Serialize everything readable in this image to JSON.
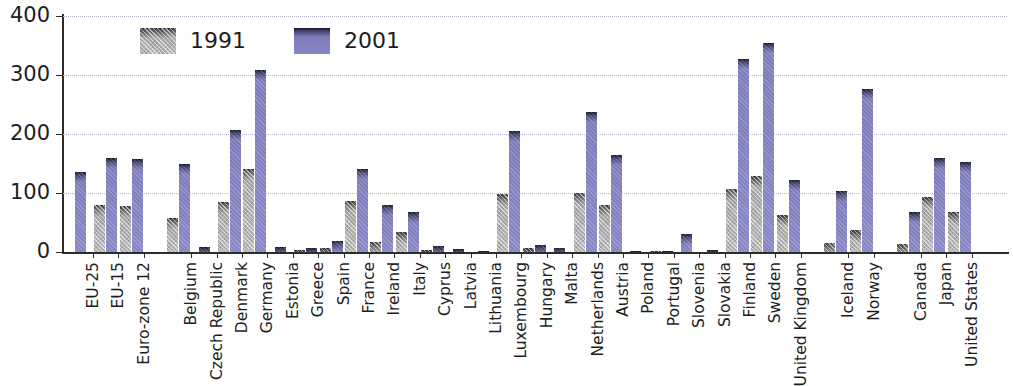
{
  "chart_data": {
    "type": "bar",
    "title": "",
    "subtitle": "",
    "xlabel": "",
    "ylabel": "",
    "ylim": [
      0,
      400
    ],
    "yticks": [
      0,
      100,
      200,
      300,
      400
    ],
    "grid": true,
    "legend_position": "top-left",
    "legend": [
      "1991",
      "2001"
    ],
    "categories": [
      "EU-25",
      "EU-15",
      "Euro-zone 12",
      "Belgium",
      "Czech Republic",
      "Denmark",
      "Germany",
      "Estonia",
      "Greece",
      "Spain",
      "France",
      "Ireland",
      "Italy",
      "Cyprus",
      "Latvia",
      "Lithuania",
      "Luxembourg",
      "Hungary",
      "Malta",
      "Netherlands",
      "Austria",
      "Poland",
      "Portugal",
      "Slovenia",
      "Slovakia",
      "Finland",
      "Sweden",
      "United Kingdom",
      "Iceland",
      "Norway",
      "Canada",
      "Japan",
      "United States"
    ],
    "group_breaks_after": [
      "Euro-zone 12",
      "United Kingdom",
      "Norway"
    ],
    "series": [
      {
        "name": "1991",
        "color": "#b8b8b8",
        "values": [
          null,
          80,
          78,
          58,
          null,
          85,
          140,
          null,
          4,
          6,
          86,
          17,
          34,
          3,
          null,
          null,
          98,
          6,
          null,
          100,
          80,
          null,
          1,
          null,
          null,
          107,
          128,
          62,
          15,
          38,
          13,
          93,
          68
        ]
      },
      {
        "name": "2001",
        "color": "#8787c6",
        "values": [
          135,
          160,
          158,
          150,
          8,
          207,
          308,
          9,
          7,
          19,
          140,
          79,
          68,
          10,
          5,
          1,
          205,
          12,
          7,
          237,
          165,
          1,
          2,
          31,
          4,
          327,
          355,
          122,
          104,
          277,
          67,
          160,
          153
        ]
      }
    ]
  },
  "axis": {
    "y_tick_labels": [
      "400",
      "300",
      "200",
      "100",
      "0"
    ]
  }
}
